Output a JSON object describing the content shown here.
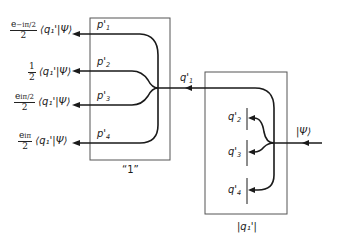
{
  "diagram": {
    "left_box": {
      "label": "“1”",
      "outputs": [
        {
          "port": "p'",
          "index": "1",
          "coefficient_num": "e",
          "coefficient_exp": "−iπ/2",
          "coefficient_den": "2",
          "bra": "⟨q₁'|Ψ⟩"
        },
        {
          "port": "p'",
          "index": "2",
          "coefficient_num": "1",
          "coefficient_exp": "",
          "coefficient_den": "2",
          "bra": "⟨q₁'|Ψ⟩"
        },
        {
          "port": "p'",
          "index": "3",
          "coefficient_num": "e",
          "coefficient_exp": "iπ/2",
          "coefficient_den": "2",
          "bra": "⟨q₁'|Ψ⟩"
        },
        {
          "port": "p'",
          "index": "4",
          "coefficient_num": "e",
          "coefficient_exp": "iπ",
          "coefficient_den": "2",
          "bra": "⟨q₁'|Ψ⟩"
        }
      ]
    },
    "connector": {
      "port": "q'",
      "index": "1"
    },
    "right_box": {
      "label": "|q₁'|",
      "input": "|Ψ⟩",
      "outputs": [
        {
          "port": "q'",
          "index": "2"
        },
        {
          "port": "q'",
          "index": "3"
        },
        {
          "port": "q'",
          "index": "4"
        }
      ]
    },
    "colors": {
      "line": "#1a1a1a",
      "box": "#555555"
    }
  }
}
